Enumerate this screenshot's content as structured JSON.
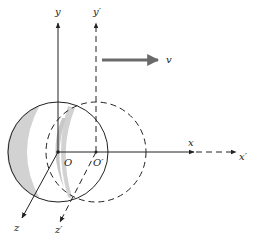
{
  "diagram": {
    "labels": {
      "y": "y",
      "y_prime": "y′",
      "x": "x",
      "x_prime": "x′",
      "z": "z",
      "z_prime": "z′",
      "origin": "O",
      "origin_prime": "O′",
      "velocity": "v"
    },
    "colors": {
      "line": "#222222",
      "velocity_arrow": "#6a6a6a",
      "shading": "#cfcfcf"
    }
  }
}
